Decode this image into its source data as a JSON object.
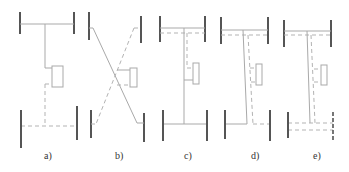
{
  "figure": {
    "panels": [
      {
        "id": "a",
        "label": "a)"
      },
      {
        "id": "b",
        "label": "b)"
      },
      {
        "id": "c",
        "label": "c)"
      },
      {
        "id": "d",
        "label": "d)"
      },
      {
        "id": "e",
        "label": "e)"
      }
    ]
  },
  "colors": {
    "wheel": "#555555",
    "line": "#a9a9a9",
    "label": "#333333"
  }
}
